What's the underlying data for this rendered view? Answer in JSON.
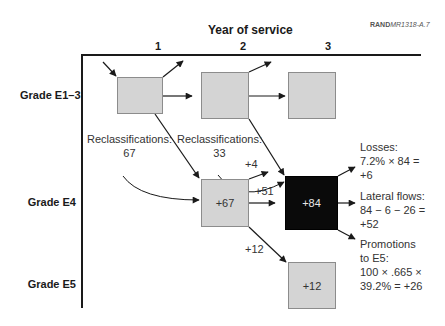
{
  "credit": {
    "prefix": "RAND",
    "code": "MR1318-A.7"
  },
  "title": "Year of service",
  "columns": [
    "1",
    "2",
    "3"
  ],
  "rows": [
    "Grade E1–3",
    "Grade E4",
    "Grade E5"
  ],
  "boxes": {
    "e13_y1": "",
    "e13_y2": "",
    "e13_y3": "",
    "e4_y2": "+67",
    "e4_y3": "+84",
    "e5_y3": "+12"
  },
  "reclass": [
    {
      "label": "Reclassifications:",
      "value": "67"
    },
    {
      "label": "Reclassifications:",
      "value": "33"
    }
  ],
  "flow_labels": {
    "plus4": "+4",
    "plus51": "+51",
    "plus12": "+12"
  },
  "notes": {
    "losses": [
      "Losses:",
      "7.2% × 84 =",
      "+6"
    ],
    "lateral": [
      "Lateral flows:",
      "84 − 6 − 26 =",
      "+52"
    ],
    "promotions": [
      "Promotions",
      "to E5:",
      "100 × .665 ×",
      "39.2% = +26"
    ]
  },
  "colors": {
    "box_fill": "#d4d4d4",
    "highlight_box": "#0a0a0a",
    "line": "#1a1a1a"
  }
}
